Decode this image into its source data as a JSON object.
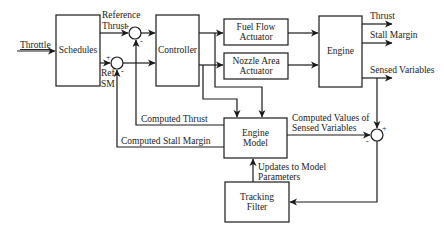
{
  "diagram": {
    "type": "block-diagram",
    "blocks": {
      "schedules": "Schedules",
      "controller": "Controller",
      "fuel_flow_actuator_line1": "Fuel Flow",
      "fuel_flow_actuator_line2": "Actuator",
      "nozzle_area_actuator_line1": "Nozzle Area",
      "nozzle_area_actuator_line2": "Actuator",
      "engine": "Engine",
      "engine_model_line1": "Engine",
      "engine_model_line2": "Model",
      "tracking_filter_line1": "Tracking",
      "tracking_filter_line2": "Filter"
    },
    "signals": {
      "throttle": "Throttle",
      "reference_thrust_line1": "Reference",
      "reference_thrust_line2": "Thrust",
      "ref_sm_line1": "Ref",
      "ref_sm_line2": "SM",
      "thrust_out": "Thrust",
      "stall_margin_out": "Stall Margin",
      "sensed_variables": "Sensed Variables",
      "computed_thrust": "Computed Thrust",
      "computed_stall_margin": "Computed Stall Margin",
      "computed_values_line1": "Computed Values of",
      "computed_values_line2": "Sensed Variables",
      "updates_line1": "Updates to Model",
      "updates_line2": "Parameters"
    },
    "summing_junctions": {
      "thrust_sum": {
        "plus": "+",
        "minus": "-"
      },
      "sm_sum": {
        "plus": "+",
        "minus": "-"
      },
      "sensed_sum": {
        "plus": "+",
        "minus": "-"
      }
    },
    "colors": {
      "line": "#1a1a1a",
      "background": "#ffffff"
    }
  }
}
